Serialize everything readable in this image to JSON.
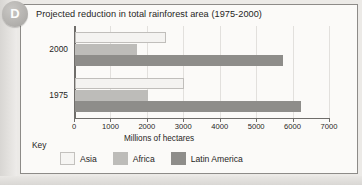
{
  "badge": {
    "letter": "D"
  },
  "chart_data": {
    "type": "bar",
    "orientation": "horizontal",
    "title": "Projected reduction in total rainforest area (1975-2000)",
    "xlabel": "Millions of hectares",
    "ylabel": "",
    "categories": [
      "1975",
      "2000"
    ],
    "category_order_top_to_bottom": [
      "2000",
      "1975"
    ],
    "series": [
      {
        "name": "Asia",
        "color": "#f4f3f1",
        "values": [
          3000,
          2500
        ]
      },
      {
        "name": "Africa",
        "color": "#bdbcb9",
        "values": [
          2000,
          1700
        ]
      },
      {
        "name": "Latin America",
        "color": "#8e8d8a",
        "values": [
          6200,
          5700
        ]
      }
    ],
    "xlim": [
      0,
      7000
    ],
    "xticks": [
      0,
      1000,
      2000,
      3000,
      4000,
      5000,
      6000,
      7000
    ],
    "xtick_labels": [
      "0",
      "1000",
      "2000",
      "3000",
      "4000",
      "5000",
      "6000",
      "7000"
    ],
    "grid": true,
    "legend_position": "bottom-left",
    "legend_title": "Key"
  },
  "legend": {
    "title": "Key",
    "items": [
      {
        "label": "Asia",
        "swatch": "asia"
      },
      {
        "label": "Africa",
        "swatch": "africa"
      },
      {
        "label": "Latin America",
        "swatch": "latin"
      }
    ]
  }
}
